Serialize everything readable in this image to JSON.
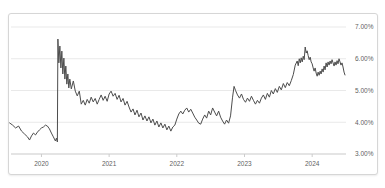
{
  "card": {
    "title": ""
  },
  "colors": {
    "background": "#ffffff",
    "card_border": "#d6d6d6",
    "gridline": "#e9e9e9",
    "axis_line": "#c9c9c9",
    "tick_mark": "#cccccc",
    "label_text": "#5f5f5f",
    "line": "#4d4d4d"
  },
  "chart_data": {
    "type": "line",
    "title": "",
    "subtitle": "",
    "xlabel": "",
    "ylabel": "",
    "legend": "none",
    "grid": "horizontal",
    "xlim": [
      2019.55,
      2024.5
    ],
    "ylim": [
      3.0,
      7.0
    ],
    "x_ticks": [
      {
        "value": 2020,
        "label": "2020"
      },
      {
        "value": 2021,
        "label": "2021"
      },
      {
        "value": 2022,
        "label": "2022"
      },
      {
        "value": 2023,
        "label": "2023"
      },
      {
        "value": 2024,
        "label": "2024"
      }
    ],
    "y_ticks": [
      {
        "value": 7.0,
        "label": "7.00%"
      },
      {
        "value": 6.0,
        "label": "6.00%"
      },
      {
        "value": 5.0,
        "label": "5.00%"
      },
      {
        "value": 4.0,
        "label": "4.00%"
      },
      {
        "value": 3.0,
        "label": "3.00%"
      }
    ],
    "series": [
      {
        "name": "rate-percent",
        "points": [
          [
            2019.529,
            3.98
          ],
          [
            2019.574,
            3.91
          ],
          [
            2019.618,
            3.82
          ],
          [
            2019.662,
            3.88
          ],
          [
            2019.706,
            3.72
          ],
          [
            2019.75,
            3.63
          ],
          [
            2019.794,
            3.54
          ],
          [
            2019.824,
            3.44
          ],
          [
            2019.853,
            3.57
          ],
          [
            2019.882,
            3.66
          ],
          [
            2019.912,
            3.6
          ],
          [
            2019.941,
            3.69
          ],
          [
            2019.971,
            3.76
          ],
          [
            2020.0,
            3.82
          ],
          [
            2020.029,
            3.85
          ],
          [
            2020.059,
            3.91
          ],
          [
            2020.088,
            3.88
          ],
          [
            2020.118,
            3.79
          ],
          [
            2020.147,
            3.66
          ],
          [
            2020.176,
            3.54
          ],
          [
            2020.206,
            3.41
          ],
          [
            2020.221,
            3.5
          ],
          [
            2020.235,
            3.38
          ],
          [
            2020.243,
            6.62
          ],
          [
            2020.257,
            5.87
          ],
          [
            2020.272,
            6.4
          ],
          [
            2020.287,
            5.71
          ],
          [
            2020.301,
            6.24
          ],
          [
            2020.316,
            5.52
          ],
          [
            2020.331,
            6.02
          ],
          [
            2020.346,
            5.36
          ],
          [
            2020.36,
            5.77
          ],
          [
            2020.375,
            5.2
          ],
          [
            2020.39,
            5.52
          ],
          [
            2020.404,
            5.08
          ],
          [
            2020.419,
            5.36
          ],
          [
            2020.441,
            5.05
          ],
          [
            2020.471,
            5.3
          ],
          [
            2020.5,
            4.98
          ],
          [
            2020.529,
            4.83
          ],
          [
            2020.559,
            4.98
          ],
          [
            2020.588,
            4.57
          ],
          [
            2020.618,
            4.69
          ],
          [
            2020.647,
            4.54
          ],
          [
            2020.676,
            4.72
          ],
          [
            2020.706,
            4.6
          ],
          [
            2020.735,
            4.79
          ],
          [
            2020.765,
            4.64
          ],
          [
            2020.794,
            4.75
          ],
          [
            2020.824,
            4.57
          ],
          [
            2020.853,
            4.72
          ],
          [
            2020.882,
            4.86
          ],
          [
            2020.912,
            4.69
          ],
          [
            2020.941,
            4.82
          ],
          [
            2020.971,
            4.66
          ],
          [
            2021.0,
            4.89
          ],
          [
            2021.029,
            4.98
          ],
          [
            2021.059,
            4.82
          ],
          [
            2021.088,
            4.91
          ],
          [
            2021.118,
            4.72
          ],
          [
            2021.147,
            4.85
          ],
          [
            2021.176,
            4.64
          ],
          [
            2021.206,
            4.75
          ],
          [
            2021.235,
            4.54
          ],
          [
            2021.265,
            4.66
          ],
          [
            2021.294,
            4.48
          ],
          [
            2021.324,
            4.32
          ],
          [
            2021.353,
            4.42
          ],
          [
            2021.382,
            4.23
          ],
          [
            2021.412,
            4.38
          ],
          [
            2021.441,
            4.17
          ],
          [
            2021.471,
            4.29
          ],
          [
            2021.5,
            4.07
          ],
          [
            2021.529,
            4.2
          ],
          [
            2021.559,
            4.04
          ],
          [
            2021.588,
            4.17
          ],
          [
            2021.618,
            3.98
          ],
          [
            2021.647,
            4.1
          ],
          [
            2021.676,
            3.91
          ],
          [
            2021.706,
            4.04
          ],
          [
            2021.735,
            3.85
          ],
          [
            2021.765,
            3.98
          ],
          [
            2021.794,
            3.82
          ],
          [
            2021.824,
            3.94
          ],
          [
            2021.853,
            3.76
          ],
          [
            2021.882,
            3.88
          ],
          [
            2021.912,
            3.72
          ],
          [
            2021.941,
            3.85
          ],
          [
            2021.971,
            3.91
          ],
          [
            2022.0,
            4.1
          ],
          [
            2022.029,
            4.26
          ],
          [
            2022.059,
            4.35
          ],
          [
            2022.088,
            4.26
          ],
          [
            2022.118,
            4.38
          ],
          [
            2022.147,
            4.45
          ],
          [
            2022.176,
            4.32
          ],
          [
            2022.206,
            4.41
          ],
          [
            2022.235,
            4.29
          ],
          [
            2022.265,
            4.16
          ],
          [
            2022.294,
            4.07
          ],
          [
            2022.324,
            3.97
          ],
          [
            2022.353,
            3.94
          ],
          [
            2022.382,
            4.1
          ],
          [
            2022.412,
            4.23
          ],
          [
            2022.441,
            4.13
          ],
          [
            2022.471,
            4.35
          ],
          [
            2022.5,
            4.23
          ],
          [
            2022.529,
            4.45
          ],
          [
            2022.559,
            4.32
          ],
          [
            2022.588,
            4.2
          ],
          [
            2022.618,
            4.35
          ],
          [
            2022.647,
            4.16
          ],
          [
            2022.676,
            4.04
          ],
          [
            2022.706,
            3.94
          ],
          [
            2022.735,
            4.07
          ],
          [
            2022.765,
            3.97
          ],
          [
            2022.794,
            4.2
          ],
          [
            2022.824,
            4.79
          ],
          [
            2022.846,
            5.13
          ],
          [
            2022.868,
            5.0
          ],
          [
            2022.897,
            4.86
          ],
          [
            2022.926,
            4.76
          ],
          [
            2022.956,
            4.89
          ],
          [
            2022.985,
            4.72
          ],
          [
            2023.015,
            4.63
          ],
          [
            2023.044,
            4.76
          ],
          [
            2023.074,
            4.66
          ],
          [
            2023.103,
            4.82
          ],
          [
            2023.132,
            4.69
          ],
          [
            2023.162,
            4.57
          ],
          [
            2023.191,
            4.69
          ],
          [
            2023.221,
            4.6
          ],
          [
            2023.25,
            4.76
          ],
          [
            2023.279,
            4.86
          ],
          [
            2023.309,
            4.72
          ],
          [
            2023.338,
            4.91
          ],
          [
            2023.368,
            4.79
          ],
          [
            2023.397,
            5.0
          ],
          [
            2023.426,
            4.89
          ],
          [
            2023.456,
            5.06
          ],
          [
            2023.485,
            4.94
          ],
          [
            2023.515,
            5.13
          ],
          [
            2023.544,
            5.02
          ],
          [
            2023.574,
            5.22
          ],
          [
            2023.603,
            5.09
          ],
          [
            2023.632,
            5.25
          ],
          [
            2023.662,
            5.15
          ],
          [
            2023.691,
            5.31
          ],
          [
            2023.721,
            5.5
          ],
          [
            2023.75,
            5.8
          ],
          [
            2023.779,
            5.93
          ],
          [
            2023.794,
            5.78
          ],
          [
            2023.809,
            6.0
          ],
          [
            2023.824,
            5.87
          ],
          [
            2023.838,
            6.03
          ],
          [
            2023.853,
            5.9
          ],
          [
            2023.868,
            6.08
          ],
          [
            2023.882,
            5.97
          ],
          [
            2023.897,
            6.37
          ],
          [
            2023.912,
            6.18
          ],
          [
            2023.926,
            6.25
          ],
          [
            2023.941,
            6.1
          ],
          [
            2023.956,
            5.97
          ],
          [
            2023.971,
            6.05
          ],
          [
            2023.985,
            5.9
          ],
          [
            2024.0,
            5.84
          ],
          [
            2024.015,
            5.71
          ],
          [
            2024.029,
            5.61
          ],
          [
            2024.044,
            5.71
          ],
          [
            2024.059,
            5.55
          ],
          [
            2024.074,
            5.45
          ],
          [
            2024.088,
            5.58
          ],
          [
            2024.103,
            5.48
          ],
          [
            2024.118,
            5.61
          ],
          [
            2024.132,
            5.52
          ],
          [
            2024.147,
            5.68
          ],
          [
            2024.162,
            5.58
          ],
          [
            2024.176,
            5.77
          ],
          [
            2024.191,
            5.65
          ],
          [
            2024.206,
            5.87
          ],
          [
            2024.221,
            5.74
          ],
          [
            2024.235,
            5.9
          ],
          [
            2024.25,
            5.8
          ],
          [
            2024.265,
            5.93
          ],
          [
            2024.279,
            5.84
          ],
          [
            2024.294,
            5.97
          ],
          [
            2024.309,
            5.87
          ],
          [
            2024.324,
            5.77
          ],
          [
            2024.338,
            5.9
          ],
          [
            2024.353,
            5.8
          ],
          [
            2024.368,
            5.94
          ],
          [
            2024.382,
            5.84
          ],
          [
            2024.397,
            6.0
          ],
          [
            2024.412,
            5.9
          ],
          [
            2024.426,
            5.8
          ],
          [
            2024.441,
            5.87
          ],
          [
            2024.456,
            5.74
          ],
          [
            2024.471,
            5.58
          ],
          [
            2024.485,
            5.49
          ]
        ]
      }
    ]
  }
}
